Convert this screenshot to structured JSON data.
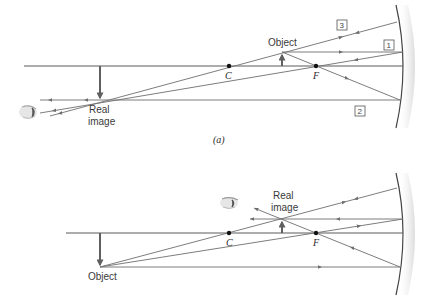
{
  "diagram": {
    "type": "concave-mirror-ray-diagram",
    "panels": [
      {
        "id": "a",
        "caption": "(a)",
        "labels": {
          "object": "Object",
          "image_line1": "Real",
          "image_line2": "image",
          "center": "C",
          "focal": "F"
        },
        "ray_numbers": [
          "1",
          "2",
          "3"
        ]
      },
      {
        "id": "b",
        "caption": "",
        "labels": {
          "image_line1": "Real",
          "image_line2": "image",
          "object": "Object",
          "center": "C",
          "focal": "F"
        }
      }
    ],
    "colors": {
      "ray": "#6e6e6e",
      "axis": "#5a5a5a",
      "arrow": "#5f5f5f",
      "mirror": "#444444"
    }
  }
}
